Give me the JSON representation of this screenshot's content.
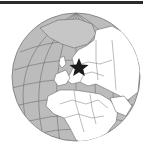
{
  "map": {
    "type": "orthographic locator globe",
    "focus_region": "Europe",
    "marker": {
      "icon": "star-icon",
      "label": "",
      "color": "#1a1a1a"
    },
    "colors": {
      "ocean": "#bcbcbc",
      "land": "#ffffff",
      "ice": "#c8c8c8",
      "borders": "#6b6b6b",
      "graticule": "#6b6b6b",
      "rule": "#2b2b2b"
    }
  }
}
